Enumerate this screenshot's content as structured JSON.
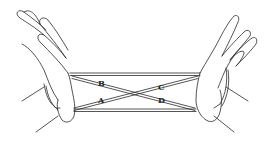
{
  "figure": {
    "labels": [
      {
        "id": "B",
        "text": "B",
        "x": 101,
        "y": 85
      },
      {
        "id": "C",
        "text": "C",
        "x": 161,
        "y": 89
      },
      {
        "id": "A",
        "text": "A",
        "x": 101,
        "y": 102
      },
      {
        "id": "D",
        "text": "D",
        "x": 161,
        "y": 102
      }
    ],
    "colors": {
      "line": "#2a2a2a",
      "background": "#ffffff"
    }
  }
}
